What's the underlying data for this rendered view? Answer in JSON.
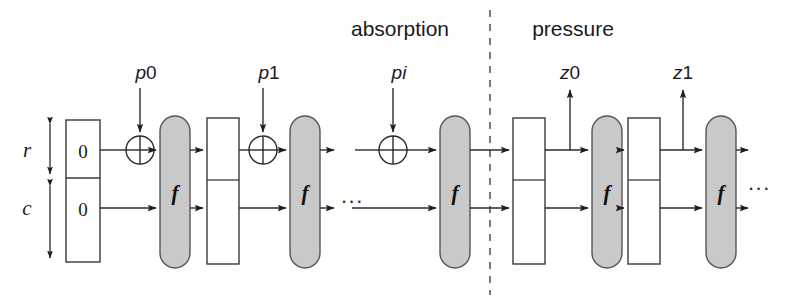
{
  "figure": {
    "width": 785,
    "height": 302,
    "background": "#ffffff"
  },
  "phases": [
    {
      "key": "absorption",
      "label": "absorption",
      "x": 400,
      "y": 36
    },
    {
      "key": "pressure",
      "label": "pressure",
      "x": 573,
      "y": 36
    }
  ],
  "separator": {
    "x": 490,
    "y1": 10,
    "y2": 295,
    "style": "dashed",
    "color": "#5a5a5a"
  },
  "rails": {
    "r": {
      "label": "r",
      "y": 150,
      "label_x": 28,
      "label_y": 157
    },
    "c": {
      "label": "c",
      "y": 208,
      "label_x": 28,
      "label_y": 215
    }
  },
  "dimensions": [
    {
      "key": "r-extent",
      "label": "r",
      "x": 50,
      "y1": 120,
      "y2": 178
    },
    {
      "key": "c-extent",
      "label": "c",
      "x": 50,
      "y1": 182,
      "y2": 262
    }
  ],
  "initial_state": {
    "x": 66,
    "y": 120,
    "width": 34,
    "height": 142,
    "divider_y": 178,
    "upper_value": "0",
    "lower_value": "0"
  },
  "inputs": [
    {
      "key": "p0",
      "prefix": "p",
      "index": "0",
      "label": "p0",
      "label_x": 145,
      "label_y": 78,
      "arrow_x": 140,
      "arrow_y1": 86,
      "arrow_y2": 136
    },
    {
      "key": "p1",
      "prefix": "p",
      "index": "1",
      "label": "p1",
      "label_x": 268,
      "label_y": 78,
      "arrow_x": 263,
      "arrow_y1": 86,
      "arrow_y2": 136
    },
    {
      "key": "pi",
      "prefix": "p",
      "index": "i",
      "label": "pi",
      "label_x": 400,
      "label_y": 78,
      "arrow_x": 393,
      "arrow_y1": 86,
      "arrow_y2": 136
    }
  ],
  "outputs": [
    {
      "key": "z0",
      "prefix": "z",
      "index": "0",
      "label": "z0",
      "label_x": 563,
      "label_y": 78,
      "arrow_x": 570,
      "arrow_y1": 150,
      "arrow_y2": 90
    },
    {
      "key": "z1",
      "prefix": "z",
      "index": "1",
      "label": "z1",
      "label_x": 676,
      "label_y": 78,
      "arrow_x": 683,
      "arrow_y1": 150,
      "arrow_y2": 90
    }
  ],
  "xor_gates": [
    {
      "key": "xor-p0",
      "cx": 140,
      "cy": 150,
      "r": 14
    },
    {
      "key": "xor-p1",
      "cx": 263,
      "cy": 150,
      "r": 14
    },
    {
      "key": "xor-pi",
      "cx": 393,
      "cy": 150,
      "r": 14
    }
  ],
  "f_blocks": [
    {
      "key": "f-absorb-0",
      "label": "f",
      "x": 160,
      "y": 116,
      "width": 30,
      "height": 152
    },
    {
      "key": "f-absorb-1",
      "label": "f",
      "x": 290,
      "y": 116,
      "width": 30,
      "height": 152
    },
    {
      "key": "f-absorb-i",
      "label": "f",
      "x": 440,
      "y": 116,
      "width": 30,
      "height": 152
    },
    {
      "key": "f-squeeze-0",
      "label": "f",
      "x": 592,
      "y": 116,
      "width": 30,
      "height": 152
    },
    {
      "key": "f-squeeze-1",
      "label": "f",
      "x": 706,
      "y": 116,
      "width": 30,
      "height": 152
    }
  ],
  "state_boxes": [
    {
      "key": "state-absorb-1",
      "x": 207,
      "y": 118,
      "width": 32,
      "height": 146,
      "divider_y": 180
    },
    {
      "key": "state-squeeze-0",
      "x": 513,
      "y": 118,
      "width": 32,
      "height": 146,
      "divider_y": 180
    },
    {
      "key": "state-squeeze-1",
      "x": 628,
      "y": 118,
      "width": 32,
      "height": 146,
      "divider_y": 180
    }
  ],
  "ellipses": [
    {
      "key": "ellipsis-absorption",
      "label": "...",
      "x": 340,
      "y": 196
    },
    {
      "key": "ellipsis-absorption-gap",
      "label": "...",
      "x": 352,
      "y": 150
    },
    {
      "key": "ellipsis-right",
      "label": "...",
      "x": 752,
      "y": 196
    }
  ],
  "colors": {
    "f_block_fill": "#c9c9c9",
    "f_block_stroke": "#555555",
    "wire": "#2b2b2b",
    "box_stroke": "#3a3a3a",
    "text": "#1a1a1a"
  }
}
